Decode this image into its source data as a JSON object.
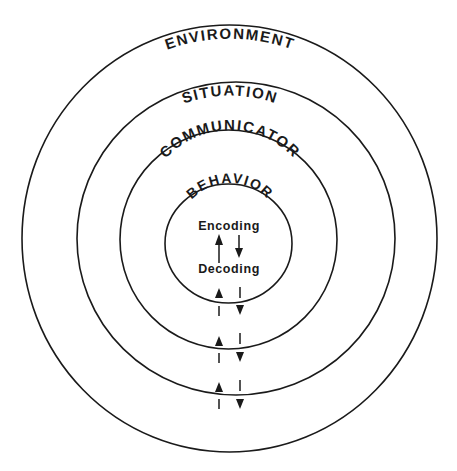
{
  "diagram": {
    "type": "nested-circles",
    "colors": {
      "stroke": "#1a1a1a",
      "background": "#ffffff"
    },
    "rings": [
      {
        "label": "ENVIRONMENT"
      },
      {
        "label": "SITUATION"
      },
      {
        "label": "COMMUNICATOR"
      },
      {
        "label": "BEHAVIOR"
      }
    ],
    "core": {
      "top_label": "Encoding",
      "bottom_label": "Decoding"
    },
    "arrows": {
      "up": "up-arrow (inward flow)",
      "down": "down-arrow (outward flow)"
    }
  }
}
